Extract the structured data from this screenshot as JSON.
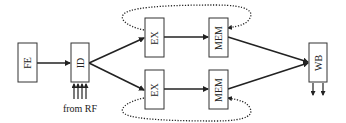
{
  "diagram": {
    "type": "pipeline",
    "stages": [
      {
        "id": "fe",
        "label": "FE"
      },
      {
        "id": "id",
        "label": "ID"
      },
      {
        "id": "ex_top",
        "label": "EX"
      },
      {
        "id": "mem_top",
        "label": "MEM"
      },
      {
        "id": "ex_bottom",
        "label": "EX"
      },
      {
        "id": "mem_bottom",
        "label": "MEM"
      },
      {
        "id": "wb",
        "label": "WB"
      }
    ],
    "edges": [
      [
        "fe",
        "id"
      ],
      [
        "id",
        "ex_top"
      ],
      [
        "id",
        "ex_bottom"
      ],
      [
        "ex_top",
        "mem_top"
      ],
      [
        "ex_bottom",
        "mem_bottom"
      ],
      [
        "mem_top",
        "wb"
      ],
      [
        "mem_bottom",
        "wb"
      ]
    ],
    "input_caption": "from RF",
    "bypass_loops": [
      "top",
      "bottom"
    ]
  }
}
